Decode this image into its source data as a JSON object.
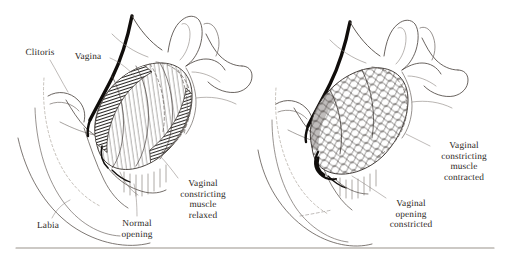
{
  "figure": {
    "background_color": "#ffffff",
    "ink_color": "#2b2723",
    "line_color": "#3a3430",
    "dark_accent_color": "#100d0b",
    "rule_color": "#9a938c",
    "width": 508,
    "height": 259
  },
  "panels": [
    {
      "id": "left-panel",
      "name": "relaxed",
      "caption": "Vaginal constricting muscle relaxed",
      "labels": [
        {
          "id": "clitoris",
          "text": "Clitoris",
          "lines": [
            "Clitoris"
          ],
          "x": 40,
          "y": 48,
          "align": "center",
          "leader": true
        },
        {
          "id": "vagina",
          "text": "Vagina",
          "lines": [
            "Vagina"
          ],
          "x": 88,
          "y": 52,
          "align": "center",
          "leader": true
        },
        {
          "id": "labia",
          "text": "Labia",
          "lines": [
            "Labia"
          ],
          "x": 48,
          "y": 221,
          "align": "center",
          "leader": true
        },
        {
          "id": "normal-opening",
          "text": "Normal opening",
          "lines": [
            "Normal",
            "opening"
          ],
          "x": 137,
          "y": 219,
          "align": "center",
          "leader": true
        },
        {
          "id": "muscle-relaxed",
          "text": "Vaginal constricting muscle relaxed",
          "lines": [
            "Vaginal",
            "constricting",
            "muscle",
            "relaxed"
          ],
          "x": 203,
          "y": 179,
          "align": "center",
          "leader": false
        }
      ]
    },
    {
      "id": "right-panel",
      "name": "contracted",
      "caption": "Vaginal constricting muscle contracted",
      "labels": [
        {
          "id": "muscle-contracted",
          "text": "Vaginal constricting muscle contracted",
          "lines": [
            "Vaginal",
            "constricting",
            "muscle contracted"
          ],
          "x": 464,
          "y": 141,
          "align": "center",
          "leader": true
        },
        {
          "id": "opening-constricted",
          "text": "Vaginal opening constricted",
          "lines": [
            "Vaginal",
            "opening",
            "constricted"
          ],
          "x": 411,
          "y": 199,
          "align": "center",
          "leader": true
        }
      ]
    }
  ],
  "rule": {
    "present": true,
    "x1": 16,
    "x2": 494,
    "y": 248
  }
}
